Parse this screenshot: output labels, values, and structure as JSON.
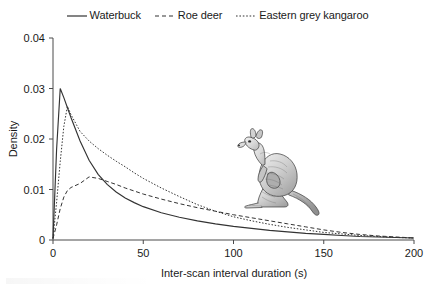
{
  "chart_data": {
    "type": "line",
    "title": "",
    "xlabel": "Inter-scan interval duration (s)",
    "ylabel": "Density",
    "xlim": [
      0,
      200
    ],
    "ylim": [
      0,
      0.04
    ],
    "xticks": [
      "0",
      "50",
      "100",
      "150",
      "200"
    ],
    "xtick_values": [
      0,
      50,
      100,
      150,
      200
    ],
    "yticks": [
      "0",
      "0.01",
      "0.02",
      "0.03",
      "0.04"
    ],
    "ytick_values": [
      0,
      0.01,
      0.02,
      0.03,
      0.04
    ],
    "grid": false,
    "legend_position": "top-center",
    "x": [
      0,
      2,
      4,
      6,
      8,
      10,
      15,
      20,
      25,
      30,
      35,
      40,
      45,
      50,
      60,
      70,
      80,
      90,
      100,
      110,
      120,
      130,
      140,
      150,
      160,
      170,
      180,
      190,
      200
    ],
    "series": [
      {
        "name": "Waterbuck",
        "linestyle": "solid",
        "color": "#333333",
        "values": [
          0.0003,
          0.018,
          0.03,
          0.0282,
          0.0262,
          0.0242,
          0.0196,
          0.0158,
          0.013,
          0.011,
          0.0095,
          0.0083,
          0.0074,
          0.0066,
          0.0054,
          0.0045,
          0.0038,
          0.0032,
          0.0027,
          0.0023,
          0.0019,
          0.0016,
          0.0013,
          0.0011,
          0.0009,
          0.0007,
          0.0006,
          0.0005,
          0.0004
        ]
      },
      {
        "name": "Roe deer",
        "linestyle": "dashed",
        "color": "#333333",
        "values": [
          0.0003,
          0.003,
          0.0062,
          0.0085,
          0.0098,
          0.0104,
          0.0112,
          0.0125,
          0.0122,
          0.0116,
          0.011,
          0.0103,
          0.0097,
          0.0091,
          0.0081,
          0.0072,
          0.0064,
          0.0057,
          0.005,
          0.0044,
          0.0038,
          0.0032,
          0.0026,
          0.002,
          0.0015,
          0.0011,
          0.0008,
          0.0006,
          0.0004
        ]
      },
      {
        "name": "Eastern grey kangaroo",
        "linestyle": "dashdot",
        "color": "#333333",
        "values": [
          0.0003,
          0.0075,
          0.0155,
          0.0225,
          0.0265,
          0.0248,
          0.0215,
          0.0196,
          0.0181,
          0.0168,
          0.0156,
          0.0145,
          0.0133,
          0.0122,
          0.0103,
          0.0086,
          0.007,
          0.0057,
          0.0046,
          0.0038,
          0.0031,
          0.0025,
          0.002,
          0.0015,
          0.0012,
          0.0009,
          0.0007,
          0.0005,
          0.0004
        ]
      }
    ]
  },
  "legend": {
    "items": [
      {
        "label": "Waterbuck",
        "style": "solid"
      },
      {
        "label": "Roe deer",
        "style": "dashed"
      },
      {
        "label": "Eastern grey kangaroo",
        "style": "dashdot"
      }
    ]
  },
  "illustration": {
    "name": "eastern-grey-kangaroo-illustration",
    "caption": ""
  }
}
